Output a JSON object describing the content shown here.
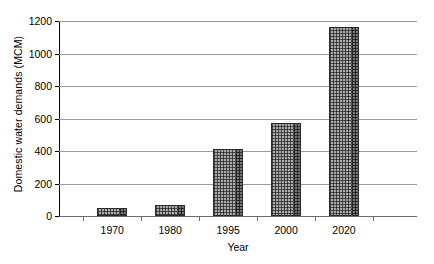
{
  "chart_data": {
    "type": "bar",
    "title": "",
    "subtitle": "",
    "xlabel": "Year",
    "ylabel": "Domestic water demands (MCM)",
    "categories": [
      "1970",
      "1980",
      "1995",
      "2000",
      "2020"
    ],
    "values": [
      50,
      67,
      415,
      575,
      1165
    ],
    "ylim": [
      0,
      1200
    ],
    "yticks": [
      0,
      200,
      400,
      600,
      800,
      1000,
      1200
    ],
    "ytick_labels": [
      "0",
      "200",
      "400",
      "600",
      "800",
      "1000",
      "1200"
    ],
    "grid": "horizontal",
    "legend": "none",
    "series": [
      {
        "name": "Domestic water demands",
        "values": [
          50,
          67,
          415,
          575,
          1165
        ]
      }
    ],
    "annotations": [],
    "style": {
      "bar_fill": "#a9a9a9",
      "bar_pattern": "checkered-dots",
      "bar_edge_shade": "#767676",
      "bar_border": "#2b2b2b",
      "gridline_color": "#9a9a9a",
      "axis_color": "#000000",
      "background": "#ffffff"
    }
  },
  "axes": {
    "y_title": "Domestic water demands (MCM)",
    "x_title": "Year"
  }
}
